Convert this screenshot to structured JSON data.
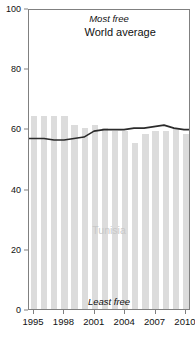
{
  "title_fragment": "",
  "chart_data": {
    "type": "bar",
    "title": "",
    "xlabel": "",
    "ylabel": "",
    "ylim": [
      0,
      100
    ],
    "xlim": [
      1994.5,
      2010.5
    ],
    "grid": false,
    "legend": "inline annotations",
    "categories": [
      1995,
      1996,
      1997,
      1998,
      1999,
      2000,
      2001,
      2002,
      2003,
      2004,
      2005,
      2006,
      2007,
      2008,
      2009,
      2010
    ],
    "series": [
      {
        "name": "Tunisia",
        "type": "bar",
        "color": "#dcdcdc",
        "values": [
          64,
          64,
          64,
          64,
          61,
          60,
          61,
          60,
          59,
          59,
          55,
          58,
          59,
          59,
          60,
          58
        ]
      },
      {
        "name": "World average",
        "type": "line",
        "color": "#2b2b2b",
        "values": [
          57,
          57,
          56.5,
          56.5,
          57,
          57.5,
          59.5,
          60,
          60,
          60,
          60.5,
          60.5,
          61,
          61.5,
          60.5,
          60
        ]
      }
    ],
    "ytick_labels": [
      "0",
      "20",
      "40",
      "60",
      "80",
      "100"
    ],
    "ytick_values": [
      0,
      20,
      40,
      60,
      80,
      100
    ],
    "xtick_labels": [
      "1995",
      "1998",
      "2001",
      "2004",
      "2007",
      "2010"
    ],
    "xtick_values": [
      1995,
      1998,
      2001,
      2004,
      2007,
      2010
    ],
    "annotations": [
      {
        "name": "most-free",
        "text": "Most free",
        "position": "top-center"
      },
      {
        "name": "least-free",
        "text": "Least free",
        "position": "bottom-center"
      },
      {
        "name": "world-average",
        "text": "World average",
        "position": "inline-line"
      },
      {
        "name": "tunisia",
        "text": "Tunisia",
        "position": "inline-bars"
      }
    ]
  },
  "labels": {
    "most_free": "Most free",
    "least_free": "Least free",
    "world_average": "World average",
    "country": "Tunisia"
  }
}
